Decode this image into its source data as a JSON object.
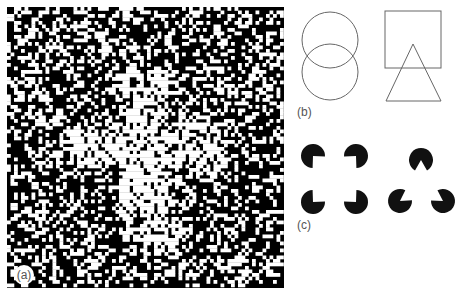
{
  "figure": {
    "panels": [
      {
        "id": "a",
        "label": "(a)",
        "description": "Random black/white dot texture with a figure cross region of inverted density",
        "bounds": {
          "x": 7,
          "y": 7,
          "width": 277,
          "height": 281
        },
        "cell_size": 3.5,
        "background_white_ratio": 0.36,
        "figure_white_ratio": 0.7,
        "seed": 1337,
        "cross": {
          "vertical": {
            "x": 120,
            "y": 70,
            "width": 48,
            "height": 172
          },
          "horizontal": {
            "x": 70,
            "y": 122,
            "width": 156,
            "height": 46
          }
        },
        "label_badge": {
          "cx": 24,
          "cy": 275,
          "r": 10
        }
      },
      {
        "id": "b",
        "label": "(b)",
        "description": "Overlapping outline figures: two circles; a square and a triangle",
        "label_position": {
          "x": 297,
          "y": 116
        },
        "stroke": "#666666",
        "shapes": {
          "circle_top": {
            "cx": 330,
            "cy": 40,
            "r": 28
          },
          "circle_bottom": {
            "cx": 330,
            "cy": 72,
            "r": 28
          },
          "square": {
            "x": 385,
            "y": 11,
            "width": 56,
            "height": 57
          },
          "triangle": {
            "points": "413,44 386,101 441,101"
          }
        }
      },
      {
        "id": "c",
        "label": "(c)",
        "description": "Kanizsa illusory contours: pacman inducers forming an illusory square and an illusory triangle",
        "label_position": {
          "x": 297,
          "y": 229
        },
        "fill": "#111111",
        "radius": 12,
        "square_inducers": [
          {
            "cx": 313,
            "cy": 156,
            "cut_toward": [
              334.5,
              179
            ]
          },
          {
            "cx": 356,
            "cy": 156,
            "cut_toward": [
              334.5,
              179
            ]
          },
          {
            "cx": 313,
            "cy": 202,
            "cut_toward": [
              334.5,
              179
            ]
          },
          {
            "cx": 356,
            "cy": 202,
            "cut_toward": [
              334.5,
              179
            ]
          }
        ],
        "square_cut_degrees": 90,
        "triangle_inducers": [
          {
            "cx": 421,
            "cy": 160,
            "cut_toward": [
              421,
              187
            ]
          },
          {
            "cx": 400,
            "cy": 201,
            "cut_toward": [
              421,
              187
            ]
          },
          {
            "cx": 443,
            "cy": 201,
            "cut_toward": [
              421,
              187
            ]
          }
        ],
        "triangle_cut_degrees": 60
      }
    ]
  }
}
